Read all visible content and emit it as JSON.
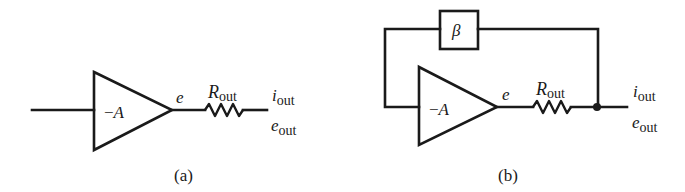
{
  "figure": {
    "panels": [
      {
        "id": "a",
        "caption": "(a)",
        "amplifier": {
          "gain_label_sign": "−",
          "gain_label": "A"
        },
        "node_label": "e",
        "resistor": {
          "label": "R",
          "subscript": "out"
        },
        "output_current": {
          "label": "i",
          "subscript": "out"
        },
        "output_voltage": {
          "label": "e",
          "subscript": "out"
        }
      },
      {
        "id": "b",
        "caption": "(b)",
        "amplifier": {
          "gain_label_sign": "−",
          "gain_label": "A"
        },
        "feedback_block": {
          "label": "β"
        },
        "node_label": "e",
        "resistor": {
          "label": "R",
          "subscript": "out"
        },
        "output_current": {
          "label": "i",
          "subscript": "out"
        },
        "output_voltage": {
          "label": "e",
          "subscript": "out"
        }
      }
    ]
  },
  "colors": {
    "ink": "#1a1a1a",
    "background": "#ffffff"
  }
}
